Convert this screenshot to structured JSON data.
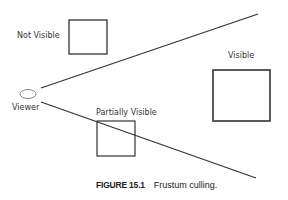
{
  "diagram": {
    "labels": {
      "not_visible": "Not Visible",
      "visible": "Visible",
      "partially_visible": "Partially Visible",
      "viewer": "Viewer"
    },
    "colors": {
      "stroke": "#333333",
      "background": "#ffffff",
      "viewer_stroke": "#888888"
    }
  },
  "caption": {
    "figure_number": "FIGURE 15.1",
    "text": "Frustum culling."
  }
}
